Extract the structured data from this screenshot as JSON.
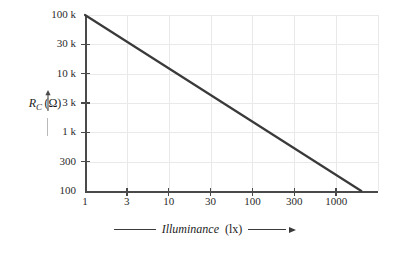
{
  "chart_data": {
    "type": "line",
    "title": "",
    "xlabel": "Illuminance",
    "xunit": "(lx)",
    "ylabel": "R_C",
    "yunit": "(Ω)",
    "xscale": "log",
    "yscale": "log",
    "xlim": [
      1,
      3000
    ],
    "ylim": [
      100,
      100000
    ],
    "grid": true,
    "legend": null,
    "xticks": [
      {
        "value": 1,
        "label": "1"
      },
      {
        "value": 3,
        "label": "3"
      },
      {
        "value": 10,
        "label": "10"
      },
      {
        "value": 30,
        "label": "30"
      },
      {
        "value": 100,
        "label": "100"
      },
      {
        "value": 300,
        "label": "300"
      },
      {
        "value": 1000,
        "label": "1000"
      }
    ],
    "yticks": [
      {
        "value": 100000,
        "label": "100 k"
      },
      {
        "value": 30000,
        "label": "30 k"
      },
      {
        "value": 10000,
        "label": "10 k"
      },
      {
        "value": 3000,
        "label": "3 k"
      },
      {
        "value": 1000,
        "label": "1 k"
      },
      {
        "value": 300,
        "label": "300"
      },
      {
        "value": 100,
        "label": "100"
      }
    ],
    "series": [
      {
        "name": "Rc vs Illuminance",
        "color": "#3a3a3a",
        "x": [
          1,
          2000
        ],
        "y": [
          100000,
          100
        ]
      }
    ]
  },
  "axis_titles": {
    "y_main": "R",
    "y_sub": "C",
    "y_unit": "(Ω)",
    "x_main": "Illuminance",
    "x_unit": "(lx)"
  },
  "colors": {
    "line": "#3a3a3a",
    "grid": "#e9e9e9",
    "axis": "#4a4a4a",
    "text": "#1d1d1d",
    "background": "#ffffff"
  }
}
